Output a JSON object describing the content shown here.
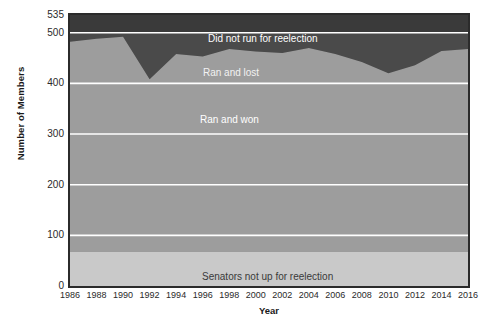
{
  "chart_data": {
    "type": "area",
    "title": "",
    "xlabel": "Year",
    "ylabel": "Number of Members",
    "xlim": [
      1986,
      2016
    ],
    "ylim": [
      0,
      535
    ],
    "grid": true,
    "grid_color": "#ffffff",
    "legend_position": "in-plot labels",
    "stacked": true,
    "x": [
      1986,
      1988,
      1990,
      1992,
      1994,
      1996,
      1998,
      2000,
      2002,
      2004,
      2006,
      2008,
      2010,
      2012,
      2014,
      2016
    ],
    "xtick_labels": [
      "1986",
      "1988",
      "1990",
      "1992",
      "1994",
      "1996",
      "1998",
      "2000",
      "2002",
      "2004",
      "2006",
      "2008",
      "2010",
      "2012",
      "2014",
      "2016"
    ],
    "ytick_labels": [
      "0",
      "100",
      "200",
      "300",
      "400",
      "500",
      "535"
    ],
    "yticks": [
      0,
      100,
      200,
      300,
      400,
      500,
      535
    ],
    "series": [
      {
        "name": "Senators not up for reelection",
        "color": "#c9c9c9",
        "values": [
          68,
          68,
          68,
          68,
          68,
          68,
          68,
          68,
          68,
          68,
          68,
          68,
          68,
          68,
          68,
          68
        ]
      },
      {
        "name": "Ran and won",
        "color": "#9d9d9d",
        "values": [
          414,
          420,
          424,
          340,
          390,
          385,
          400,
          395,
          392,
          402,
          390,
          374,
          352,
          368,
          396,
          400
        ]
      },
      {
        "name": "Ran and lost",
        "color": "#4a4a4a",
        "values": [
          18,
          12,
          8,
          92,
          45,
          47,
          32,
          37,
          40,
          30,
          42,
          58,
          80,
          64,
          36,
          32
        ]
      },
      {
        "name": "Did not run for reelection",
        "color": "#3a3a3a",
        "values": [
          35,
          35,
          35,
          35,
          35,
          35,
          35,
          35,
          35,
          35,
          35,
          35,
          35,
          35,
          35,
          35
        ]
      }
    ],
    "band_tops": {
      "senators_not_up": [
        68,
        68,
        68,
        68,
        68,
        68,
        68,
        68,
        68,
        68,
        68,
        68,
        68,
        68,
        68,
        68
      ],
      "ran_and_won": [
        482,
        488,
        492,
        408,
        458,
        453,
        468,
        463,
        460,
        470,
        458,
        442,
        420,
        436,
        464,
        468
      ],
      "ran_and_lost": [
        500,
        500,
        500,
        500,
        500,
        500,
        500,
        500,
        500,
        500,
        500,
        500,
        500,
        500,
        500,
        500
      ],
      "top_of_chart": [
        535,
        535,
        535,
        535,
        535,
        535,
        535,
        535,
        535,
        535,
        535,
        535,
        535,
        535,
        535,
        535
      ]
    },
    "labels": {
      "did_not_run": "Did not run for reelection",
      "ran_and_lost": "Ran and lost",
      "ran_and_won": "Ran and won",
      "senators_not_up": "Senators not up for reelection"
    }
  }
}
